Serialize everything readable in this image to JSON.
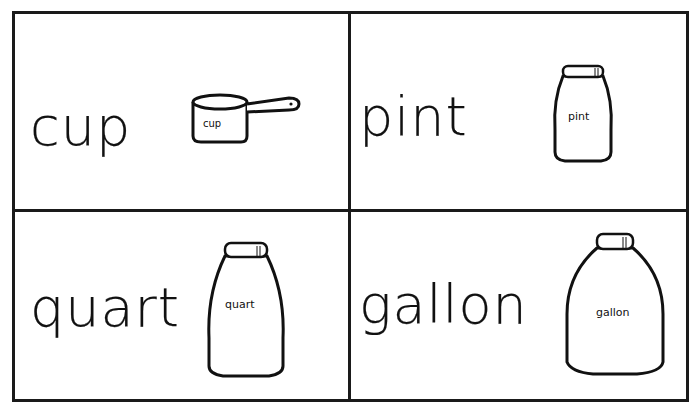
{
  "cards": [
    {
      "word": "cup",
      "label": "cup",
      "icon": "measuring-cup-icon"
    },
    {
      "word": "pint",
      "label": "pint",
      "icon": "pint-bottle-icon"
    },
    {
      "word": "quart",
      "label": "quart",
      "icon": "quart-bottle-icon"
    },
    {
      "word": "gallon",
      "label": "gallon",
      "icon": "gallon-jug-icon"
    }
  ],
  "colors": {
    "ink": "#1a1a1a",
    "paper": "#ffffff"
  }
}
